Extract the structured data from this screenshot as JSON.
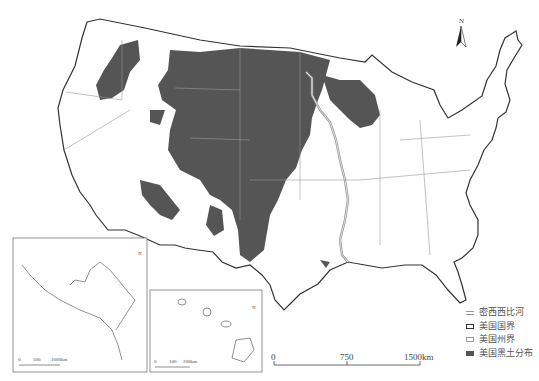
{
  "map": {
    "subject": "United States black soil distribution",
    "north_arrow": {
      "label": "N"
    },
    "main_scale": {
      "ticks": [
        "0",
        "750",
        "1500km"
      ]
    },
    "alaska_inset": {
      "scale_ticks": [
        "0",
        "500",
        "1000km"
      ],
      "north_label": "N"
    },
    "hawaii_inset": {
      "scale_ticks": [
        "0",
        "100",
        "200km"
      ],
      "north_label": "N"
    },
    "legend": [
      {
        "label": "密西西比河",
        "symbol": "river"
      },
      {
        "label": "美国国界",
        "symbol": "national-border"
      },
      {
        "label": "美国州界",
        "symbol": "state-border"
      },
      {
        "label": "美国黑土分布",
        "symbol": "black-soil"
      }
    ],
    "colors": {
      "black_soil": "#555555",
      "river": "#999999",
      "national_border": "#333333",
      "state_border": "#888888"
    }
  }
}
